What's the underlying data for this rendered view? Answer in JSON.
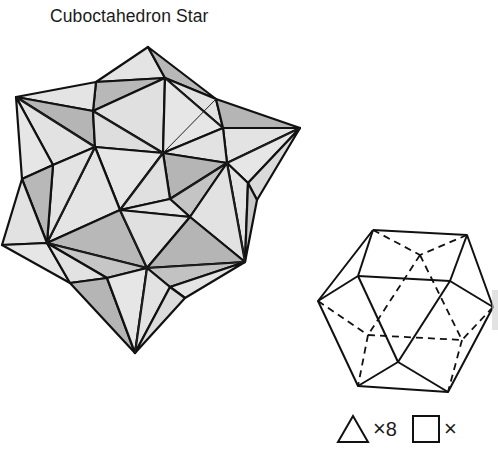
{
  "title": "Cuboctahedron Star",
  "figures": {
    "star": {
      "name": "cuboctahedron-star",
      "shading": {
        "light": "#e4e4e4",
        "mid": "#cfcfcf",
        "dark": "#b3b3b3",
        "edge": "#111111"
      }
    },
    "base": {
      "name": "cuboctahedron-wireframe",
      "edge": "#111111",
      "hidden_edge_style": "dashed"
    }
  },
  "legend": {
    "items": [
      {
        "shape": "triangle",
        "multiplier": "×",
        "count": "8"
      },
      {
        "shape": "square",
        "multiplier": "×",
        "count": ""
      }
    ]
  }
}
